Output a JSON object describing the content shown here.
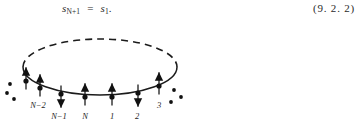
{
  "equation": {
    "lhs_symbol": "s",
    "lhs_subscript": "N+1",
    "relation": "=",
    "rhs_symbol": "s",
    "rhs_subscript": "1",
    "terminator": ".",
    "number": "(9. 2. 2)"
  },
  "figure": {
    "caption_alt": "periodic ring of N spins with sites labelled N-2, N-1, N, 1, 2, 3",
    "ring": {
      "center_x": 100,
      "center_y": 47,
      "radius_x": 77,
      "radius_y": 28,
      "upper_half_style": "dashed",
      "lower_half_style": "solid",
      "stroke_color": "#1b1b1b"
    },
    "sites": [
      {
        "label": "",
        "x": 26,
        "y": 61,
        "arrow": "up",
        "label_x": 0,
        "label_y": 0
      },
      {
        "label": "N−2",
        "x": 40,
        "y": 68,
        "arrow": "up",
        "label_x": 38,
        "label_y": 88
      },
      {
        "label": "N−1",
        "x": 61,
        "y": 74,
        "arrow": "down",
        "label_x": 59,
        "label_y": 99
      },
      {
        "label": "N",
        "x": 85,
        "y": 77,
        "arrow": "up",
        "label_x": 85,
        "label_y": 99
      },
      {
        "label": "1",
        "x": 112,
        "y": 77,
        "arrow": "up",
        "label_x": 112,
        "label_y": 99
      },
      {
        "label": "2",
        "x": 138,
        "y": 73,
        "arrow": "down",
        "label_x": 137,
        "label_y": 99
      },
      {
        "label": "3",
        "x": 159,
        "y": 66,
        "arrow": "up",
        "label_x": 159,
        "label_y": 88
      }
    ],
    "ellipsis_left": [
      {
        "x": 10,
        "y": 64
      },
      {
        "x": 7,
        "y": 73
      },
      {
        "x": 14,
        "y": 79
      }
    ],
    "ellipsis_right": [
      {
        "x": 174,
        "y": 70
      },
      {
        "x": 181,
        "y": 77
      },
      {
        "x": 171,
        "y": 82
      }
    ]
  }
}
